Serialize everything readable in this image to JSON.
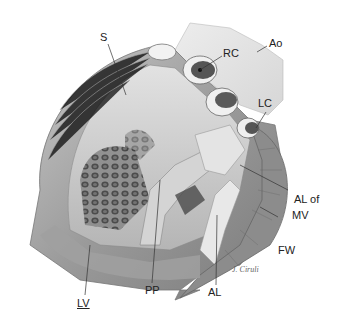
{
  "figure": {
    "labels": [
      {
        "id": "S",
        "text": "S"
      },
      {
        "id": "RC",
        "text": "RC"
      },
      {
        "id": "Ao",
        "text": "Ao"
      },
      {
        "id": "LC",
        "text": "LC"
      },
      {
        "id": "AL_of_MV_1",
        "text": "AL of"
      },
      {
        "id": "AL_of_MV_2",
        "text": "MV"
      },
      {
        "id": "FW",
        "text": "FW"
      },
      {
        "id": "AL",
        "text": "AL"
      },
      {
        "id": "PP",
        "text": "PP"
      },
      {
        "id": "LV",
        "text": "LV"
      }
    ],
    "signature": "J. Ciruli",
    "colors": {
      "background": "#ffffff",
      "tissue_light": "#d9d9d9",
      "tissue_mid": "#a8a8a8",
      "tissue_dark": "#5a5a5a",
      "label_text": "#222222",
      "leader_line": "#333333"
    }
  }
}
